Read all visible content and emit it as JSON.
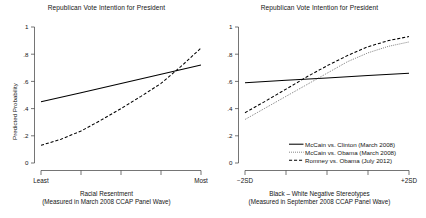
{
  "chart_data": [
    {
      "panel": "left",
      "type": "line",
      "title": "Republican Vote Intention for President",
      "ylabel": "Predicted Probability",
      "xlabel_line1": "Racial Resentment",
      "xlabel_line2": "(Measured in March 2008 CCAP Panel Wave)",
      "ylim": [
        0,
        1
      ],
      "yticks": [
        "0",
        ".2",
        ".4",
        ".6",
        ".8",
        "1"
      ],
      "ytick_values": [
        0,
        0.2,
        0.4,
        0.6,
        0.8,
        1
      ],
      "xlim": [
        0,
        1
      ],
      "xticks": [
        "Least",
        "",
        "",
        "",
        "Most"
      ],
      "xtick_values": [
        0,
        0.25,
        0.5,
        0.75,
        1
      ],
      "grid": false,
      "legend": "none",
      "series": [
        {
          "name": "McCain vs. Clinton (March 2008)",
          "style": "solid",
          "x": [
            0,
            0.25,
            0.5,
            0.75,
            1
          ],
          "values": [
            0.45,
            0.517,
            0.585,
            0.652,
            0.72
          ]
        },
        {
          "name": "McCain vs. Obama (March 2008)",
          "style": "dashed",
          "x": [
            0,
            0.125,
            0.25,
            0.375,
            0.5,
            0.625,
            0.75,
            0.875,
            1
          ],
          "values": [
            0.13,
            0.175,
            0.235,
            0.315,
            0.4,
            0.49,
            0.585,
            0.71,
            0.845
          ]
        }
      ]
    },
    {
      "panel": "right",
      "type": "line",
      "title": "Republican Vote Intention for President",
      "ylabel": "",
      "xlabel_line1": "Black – White Negative Stereotypes",
      "xlabel_line2": "(Measured in September 2008 CCAP Panel Wave)",
      "ylim": [
        0,
        1
      ],
      "yticks": [
        "0",
        ".2",
        ".4",
        ".6",
        ".8",
        "1"
      ],
      "ytick_values": [
        0,
        0.2,
        0.4,
        0.6,
        0.8,
        1
      ],
      "xlim": [
        0,
        1
      ],
      "xticks": [
        "-2SD",
        "",
        "",
        "",
        "+2SD"
      ],
      "xtick_values": [
        0,
        0.25,
        0.5,
        0.75,
        1
      ],
      "grid": false,
      "legend": "bottom-right",
      "series": [
        {
          "name": "McCain vs. Clinton (March 2008)",
          "style": "solid",
          "x": [
            0,
            0.25,
            0.5,
            0.75,
            1
          ],
          "values": [
            0.59,
            0.608,
            0.625,
            0.643,
            0.66
          ]
        },
        {
          "name": "McCain vs. Obama (March 2008)",
          "style": "dotted",
          "x": [
            0,
            0.125,
            0.25,
            0.375,
            0.5,
            0.625,
            0.75,
            0.875,
            1
          ],
          "values": [
            0.32,
            0.405,
            0.49,
            0.575,
            0.66,
            0.745,
            0.81,
            0.858,
            0.89
          ]
        },
        {
          "name": "Romney vs. Obama (July 2012)",
          "style": "dashed",
          "x": [
            0,
            0.125,
            0.25,
            0.375,
            0.5,
            0.625,
            0.75,
            0.875,
            1
          ],
          "values": [
            0.37,
            0.455,
            0.543,
            0.632,
            0.715,
            0.79,
            0.855,
            0.9,
            0.93
          ]
        }
      ]
    }
  ],
  "legend": {
    "entries": [
      {
        "label": "McCain vs. Clinton (March 2008)",
        "style": "solid"
      },
      {
        "label": "McCain vs. Obama (March 2008)",
        "style": "dotted"
      },
      {
        "label": "Romney vs. Obama (July 2012)",
        "style": "dashed"
      }
    ]
  },
  "colors": {
    "line": "#000000",
    "dotted_line": "#555555",
    "axis": "#3a3a3a",
    "text": "#141414",
    "background": "#ffffff"
  }
}
